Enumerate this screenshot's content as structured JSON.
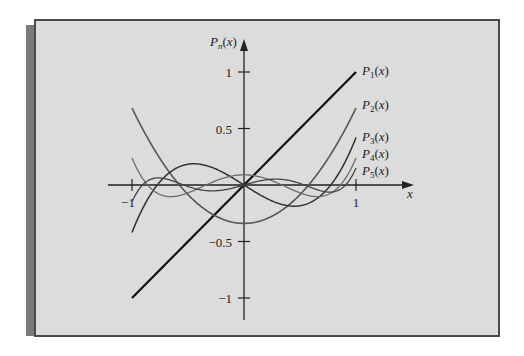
{
  "chart_data": {
    "type": "line",
    "title": "",
    "xlabel": "x",
    "ylabel": "P_n(x)",
    "xlim": [
      -1,
      1
    ],
    "ylim": [
      -1,
      1
    ],
    "x_ticks": [
      -1,
      1
    ],
    "x_tick_labels": [
      "−1",
      "1"
    ],
    "y_ticks": [
      1,
      0.5,
      -0.5,
      -1
    ],
    "y_tick_labels": [
      "1",
      "0.5",
      "−0.5",
      "−1"
    ],
    "grid": false,
    "legend": "inline labels at right end of curves",
    "series": [
      {
        "name": "P1(x)",
        "label_main": "P",
        "label_sub": "1",
        "label_tail": "(x)",
        "scale": 1.0,
        "color": "#111111",
        "width": 2.2,
        "coeffs": [
          0,
          1
        ]
      },
      {
        "name": "P2(x)",
        "label_main": "P",
        "label_sub": "2",
        "label_tail": "(x)",
        "scale": 0.68,
        "color": "#555555",
        "width": 1.6,
        "coeffs": [
          -0.5,
          0,
          1.5
        ]
      },
      {
        "name": "P3(x)",
        "label_main": "P",
        "label_sub": "3",
        "label_tail": "(x)",
        "scale": 0.42,
        "color": "#333333",
        "width": 1.5,
        "coeffs": [
          0,
          -1.5,
          0,
          2.5
        ]
      },
      {
        "name": "P4(x)",
        "label_main": "P",
        "label_sub": "4",
        "label_tail": "(x)",
        "scale": 0.24,
        "color": "#6a6a6a",
        "width": 1.3,
        "coeffs": [
          0.375,
          0,
          -3.75,
          0,
          4.375
        ]
      },
      {
        "name": "P5(x)",
        "label_main": "P",
        "label_sub": "5",
        "label_tail": "(x)",
        "scale": 0.15,
        "color": "#444444",
        "width": 1.3,
        "coeffs": [
          0,
          1.875,
          0,
          -8.75,
          0,
          7.875
        ]
      }
    ],
    "sample_values": {
      "x": [
        -1,
        -0.5,
        0,
        0.5,
        1
      ],
      "P1": [
        -1,
        -0.5,
        0,
        0.5,
        1
      ],
      "P2": [
        0.68,
        -0.04,
        -0.34,
        -0.04,
        0.68
      ],
      "P3": [
        -0.42,
        0.12,
        0,
        -0.12,
        0.42
      ],
      "P4": [
        0.24,
        -0.06,
        0.09,
        -0.06,
        0.24
      ],
      "P5": [
        -0.15,
        -0.13,
        0,
        0.13,
        0.15
      ]
    }
  }
}
